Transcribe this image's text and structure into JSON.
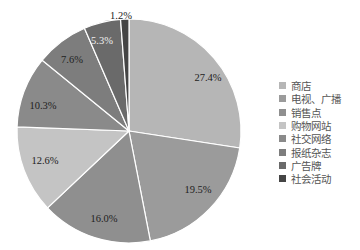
{
  "chart_data": {
    "type": "pie",
    "title": "",
    "categories": [
      "商店",
      "电视、广播",
      "销售点",
      "购物网站",
      "社交网络",
      "报纸杂志",
      "广告牌",
      "社会活动"
    ],
    "values": [
      27.4,
      19.5,
      16.0,
      12.6,
      10.3,
      7.6,
      5.3,
      1.2
    ],
    "labels": [
      "27.4%",
      "19.5%",
      "16.0%",
      "12.6%",
      "10.3%",
      "7.6%",
      "5.3%",
      "1.2%"
    ],
    "colors": [
      "#b6b6b6",
      "#9b9b9b",
      "#8f8f8f",
      "#c4c4c4",
      "#8a8a8a",
      "#7d7d7d",
      "#6a6a6a",
      "#454545"
    ],
    "start_angle": "top",
    "direction": "clockwise",
    "legend_position": "right"
  }
}
